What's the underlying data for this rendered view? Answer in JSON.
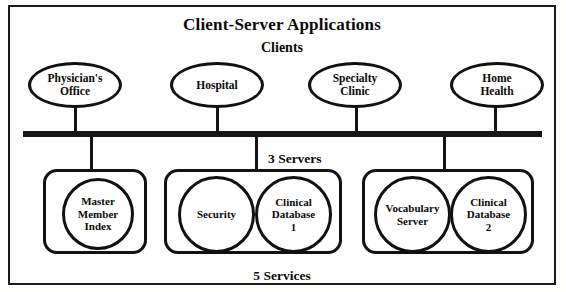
{
  "diagram": {
    "title": "Client-Server Applications",
    "clients_heading": "Clients",
    "servers_caption": "3 Servers",
    "services_caption": "5 Services",
    "accent_color": "#111111",
    "background_color": "#fefefe",
    "clients": [
      {
        "label": "Physician's\nOffice"
      },
      {
        "label": "Hospital"
      },
      {
        "label": "Specialty\nClinic"
      },
      {
        "label": "Home\nHealth"
      }
    ],
    "servers": [
      {
        "services": [
          {
            "label": "Master\nMember\nIndex"
          }
        ]
      },
      {
        "services": [
          {
            "label": "Security"
          },
          {
            "label": "Clinical\nDatabase\n1"
          }
        ]
      },
      {
        "services": [
          {
            "label": "Vocabulary\nServer"
          },
          {
            "label": "Clinical\nDatabase\n2"
          }
        ]
      }
    ]
  }
}
